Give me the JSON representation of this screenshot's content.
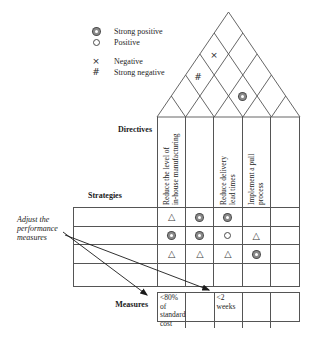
{
  "colors": {
    "ink": "#222222",
    "line": "#555555"
  },
  "legend": {
    "items": [
      {
        "symbol": "strong-positive",
        "label": "Strong positive"
      },
      {
        "symbol": "positive",
        "label": "Positive"
      },
      {
        "symbol": "negative",
        "label": "Negative"
      },
      {
        "symbol": "strong-negative",
        "label": "Strong negative"
      }
    ]
  },
  "labels": {
    "directives": "Directives",
    "strategies": "Strategies",
    "measures": "Measures"
  },
  "note": {
    "text": "Adjust the\nperformance\nmeasures"
  },
  "roof": {
    "correlations": [
      {
        "pair": "column1-column4",
        "symbol": "negative"
      },
      {
        "pair": "column1-column3",
        "symbol": "strong-negative"
      },
      {
        "pair": "column3-column4",
        "symbol": "strong-positive"
      }
    ]
  },
  "columns": [
    {
      "title": "Reduce the level of\nin-house manufacturing"
    },
    {
      "title": ""
    },
    {
      "title": "Reduce delivery\nlead times"
    },
    {
      "title": "Implement a pull\nprocess"
    },
    {
      "title": ""
    }
  ],
  "matrix": {
    "rows": [
      {
        "cells": [
          "triangle",
          "strong-positive",
          "strong-positive",
          "",
          ""
        ]
      },
      {
        "cells": [
          "strong-positive",
          "strong-positive",
          "positive",
          "triangle",
          ""
        ]
      },
      {
        "cells": [
          "triangle",
          "triangle",
          "triangle",
          "strong-positive",
          ""
        ]
      },
      {
        "cells": [
          "",
          "",
          "",
          "",
          ""
        ]
      }
    ]
  },
  "measures": {
    "cells": [
      "<80% of\nstandard\ncost",
      "",
      "<2\nweeks",
      "",
      ""
    ]
  }
}
